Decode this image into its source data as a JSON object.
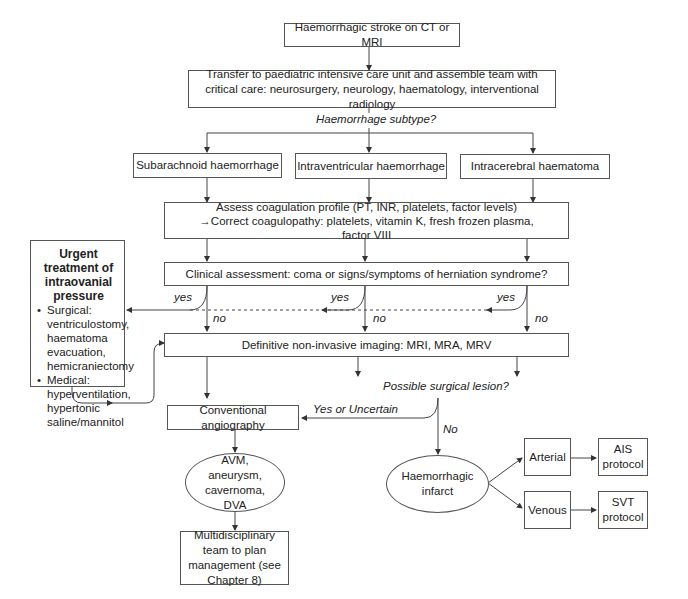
{
  "nodes": {
    "start": "Haemorrhagic stroke on CT or MRI",
    "transfer": "Transfer to paediatric intensive care unit and assemble team with critical care: neurosurgery, neurology, haematology, interventional radiology",
    "subtype_question": "Haemorrhage subtype?",
    "subarachnoid": "Subarachnoid haemorrhage",
    "intraventricular": "Intraventricular haemorrhage",
    "intracerebral": "Intracerebral haematoma",
    "coagulation": "Assess coagulation profile (PT, INR, platelets, factor levels) →Correct coagulopathy: platelets, vitamin K, fresh frozen plasma, factor VIII",
    "clinical": "Clinical assessment: coma or signs/symptoms of herniation syndrome?",
    "imaging": "Definitive non-invasive imaging: MRI, MRA, MRV",
    "surgical_question": "Possible surgical lesion?",
    "angiography": "Conventional angiography",
    "avm": "AVM, aneurysm, cavernoma, DVA",
    "mdt": "Multidisciplinary team to plan management (see Chapter 8)",
    "infarct": "Haemorrhagic infarct",
    "arterial": "Arterial",
    "venous": "Venous",
    "ais": "AIS protocol",
    "svt": "SVT protocol"
  },
  "side_box": {
    "title": "Urgent treatment of intraovanial pressure",
    "items": [
      "Surgical: ventriculostomy, haematoma evacuation, hemicraniectomy",
      "Medical: hyperventilation, hypertonic saline/mannitol"
    ]
  },
  "edge_labels": {
    "yes1": "yes",
    "yes2": "yes",
    "yes3": "yes",
    "no1": "no",
    "no2": "no",
    "no3": "no",
    "yes_uncertain": "Yes or Uncertain",
    "no_surgical": "No"
  }
}
